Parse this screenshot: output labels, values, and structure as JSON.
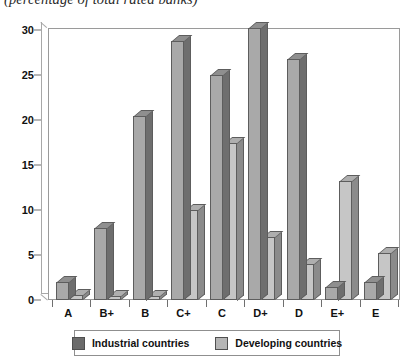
{
  "chart_data": {
    "type": "bar",
    "title": "(percentage of total rated banks)",
    "subtitle": "(percentage of total rated banks)",
    "xlabel": "",
    "ylabel": "",
    "ylim": [
      0,
      31
    ],
    "yticks": [
      0,
      5,
      10,
      15,
      20,
      25,
      30
    ],
    "grid": false,
    "legend_position": "bottom",
    "categories": [
      "A",
      "B+",
      "B",
      "C+",
      "C",
      "D+",
      "D",
      "E+",
      "E"
    ],
    "series": [
      {
        "name": "Industrial countries",
        "color": "#6b6b6b",
        "values": [
          2.0,
          8.0,
          20.5,
          28.8,
          25.0,
          30.2,
          26.8,
          1.5,
          2.0
        ]
      },
      {
        "name": "Developing countries",
        "color": "#b5b5b5",
        "values": [
          0.6,
          0.4,
          0.4,
          10.0,
          17.5,
          7.0,
          4.0,
          13.2,
          5.2
        ]
      }
    ]
  },
  "legend": {
    "items": [
      {
        "label": "Industrial countries"
      },
      {
        "label": "Developing countries"
      }
    ]
  }
}
